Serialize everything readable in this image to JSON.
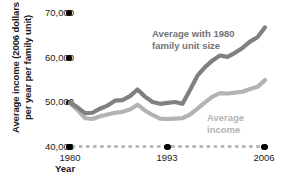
{
  "chart_data": {
    "type": "line",
    "title": "",
    "xlabel": "Year",
    "ylabel": "Average income (2006 dollars\nper year per family unit)",
    "xlim": [
      1980,
      2006
    ],
    "ylim": [
      40000,
      70000
    ],
    "grid": false,
    "legend_position": "inline-annotation",
    "x_tick_labels": [
      "1980",
      "1993",
      "2006"
    ],
    "x_ticks": [
      1980,
      1993,
      2006
    ],
    "y_tick_labels": [
      "40,000",
      "50,000",
      "60,000",
      "70,000"
    ],
    "y_ticks": [
      40000,
      50000,
      60000,
      70000
    ],
    "x": [
      1980,
      1981,
      1982,
      1983,
      1984,
      1985,
      1986,
      1987,
      1988,
      1989,
      1990,
      1991,
      1992,
      1993,
      1994,
      1995,
      1996,
      1997,
      1998,
      1999,
      2000,
      2001,
      2002,
      2003,
      2004,
      2005,
      2006
    ],
    "series": [
      {
        "name": "Average with 1980 family unit size",
        "color": "#808080",
        "label_text": "Average with 1980\nfamily unit size",
        "values": [
          50000,
          48900,
          47600,
          47700,
          48600,
          49300,
          50400,
          50500,
          51400,
          52900,
          51300,
          50100,
          49700,
          49900,
          50100,
          49700,
          52800,
          56000,
          57900,
          59400,
          60500,
          60200,
          61100,
          62200,
          63600,
          64600,
          66800
        ]
      },
      {
        "name": "Average income",
        "color": "#b3b3b3",
        "label_text": "Average\nincome",
        "values": [
          49800,
          48300,
          46500,
          46300,
          46900,
          47300,
          47700,
          47900,
          48400,
          49500,
          48200,
          47200,
          46400,
          46300,
          46400,
          46500,
          47300,
          48600,
          50000,
          51300,
          52100,
          52000,
          52200,
          52400,
          53000,
          53500,
          55000
        ]
      }
    ]
  },
  "axes": {
    "y_title": "Average income (2006 dollars\nper year per family unit)",
    "x_title": "Year"
  }
}
